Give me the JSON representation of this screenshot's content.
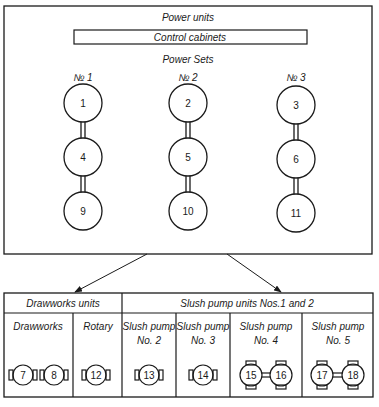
{
  "top": {
    "title": "Power units",
    "control": "Control cabinets",
    "sets_title": "Power Sets",
    "sets": [
      {
        "label": "№ 1",
        "units": [
          "1",
          "4",
          "9"
        ]
      },
      {
        "label": "№ 2",
        "units": [
          "2",
          "5",
          "10"
        ]
      },
      {
        "label": "№ 3",
        "units": [
          "3",
          "6",
          "11"
        ]
      }
    ]
  },
  "bottom": {
    "group1": "Drawworks units",
    "group2": "Slush pump units Nos.1 and 2",
    "columns": [
      {
        "l1": "Drawworks",
        "l2": "",
        "units": [
          "7",
          "8"
        ]
      },
      {
        "l1": "Rotary",
        "l2": "",
        "units": [
          "12"
        ]
      },
      {
        "l1": "Slush pump",
        "l2": "No. 2",
        "units": [
          "13"
        ]
      },
      {
        "l1": "Slush pump",
        "l2": "No. 3",
        "units": [
          "14"
        ]
      },
      {
        "l1": "Slush pump",
        "l2": "No. 4",
        "units": [
          "15",
          "16"
        ]
      },
      {
        "l1": "Slush pump",
        "l2": "No. 5",
        "units": [
          "17",
          "18"
        ]
      }
    ]
  }
}
